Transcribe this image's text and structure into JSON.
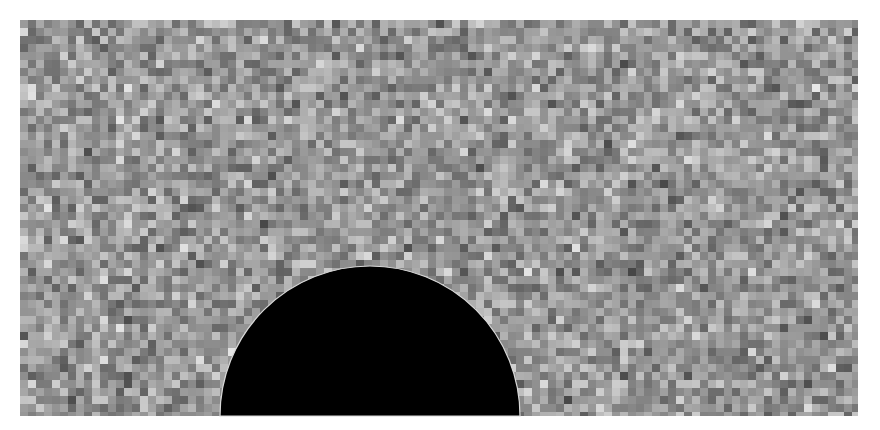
{
  "canvas": {
    "width": 880,
    "height": 430,
    "background": "#ffffff"
  },
  "noise_field": {
    "x": 20,
    "y": 20,
    "width": 838,
    "height": 396,
    "cell_size": 8,
    "seed": 1337,
    "gray_mean": 150,
    "gray_spread": 85,
    "gray_min": 40,
    "gray_max": 245
  },
  "semicircle": {
    "center_x": 370,
    "base_y": 416,
    "radius": 150,
    "fill": "#000000",
    "outline": "#d8d8d8",
    "outline_width": 1.2
  }
}
